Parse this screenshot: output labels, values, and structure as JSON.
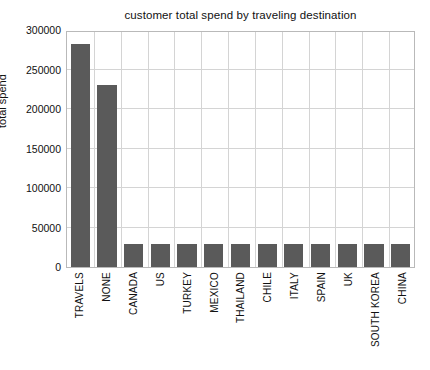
{
  "chart_data": {
    "type": "bar",
    "title": "customer total spend by traveling destination",
    "xlabel": "",
    "ylabel": "total spend",
    "categories": [
      "TRAVELS",
      "NONE",
      "CANADA",
      "US",
      "TURKEY",
      "MEXICO",
      "THAILAND",
      "CHILE",
      "ITALY",
      "SPAIN",
      "UK",
      "SOUTH KOREA",
      "CHINA"
    ],
    "values": [
      282000,
      230000,
      29000,
      29000,
      29000,
      29000,
      29000,
      29000,
      29000,
      29000,
      29000,
      29000,
      29000
    ],
    "ylim": [
      0,
      300000
    ],
    "yticks": [
      0,
      50000,
      100000,
      150000,
      200000,
      250000,
      300000
    ],
    "ytick_labels": [
      "0",
      "50000",
      "100000",
      "150000",
      "200000",
      "250000",
      "300000"
    ],
    "grid": "vertical",
    "legend": "none",
    "bar_color": "#5a5a5a",
    "grid_color": "#d4d4d4",
    "axes_color": "#b9b9b9",
    "background": "#ffffff"
  }
}
